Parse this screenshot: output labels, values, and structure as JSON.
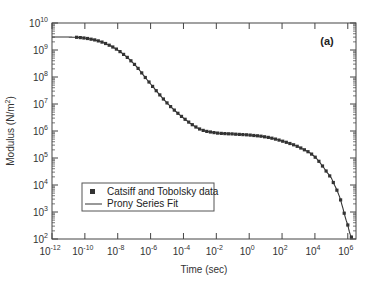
{
  "chart_data": {
    "type": "line",
    "title": "",
    "panel_label": "(a)",
    "xlabel": "Time (sec)",
    "ylabel": "Modulus (N/m",
    "ylabel_sup": "2",
    "ylabel_close": ")",
    "xscale": "log",
    "yscale": "log",
    "xlim_log10": [
      -12,
      6.5
    ],
    "ylim_log10": [
      2,
      10
    ],
    "x_ticks": [
      {
        "base": "10",
        "exp": "-12"
      },
      {
        "base": "10",
        "exp": "-10"
      },
      {
        "base": "10",
        "exp": "-8"
      },
      {
        "base": "10",
        "exp": "-6"
      },
      {
        "base": "10",
        "exp": "-4"
      },
      {
        "base": "10",
        "exp": "-2"
      },
      {
        "base": "10",
        "exp": "0"
      },
      {
        "base": "10",
        "exp": "2"
      },
      {
        "base": "10",
        "exp": "4"
      },
      {
        "base": "10",
        "exp": "6"
      }
    ],
    "y_ticks": [
      {
        "base": "10",
        "exp": "2"
      },
      {
        "base": "10",
        "exp": "3"
      },
      {
        "base": "10",
        "exp": "4"
      },
      {
        "base": "10",
        "exp": "5"
      },
      {
        "base": "10",
        "exp": "6"
      },
      {
        "base": "10",
        "exp": "7"
      },
      {
        "base": "10",
        "exp": "8"
      },
      {
        "base": "10",
        "exp": "9"
      },
      {
        "base": "10",
        "exp": "10"
      }
    ],
    "grid": false,
    "legend_position": "lower-left",
    "legend": [
      {
        "label": "Catsiff and Tobolsky data",
        "marker": "square"
      },
      {
        "label": "Prony Series Fit",
        "marker": "line"
      }
    ],
    "series": [
      {
        "name": "Prony Series Fit",
        "style": "line",
        "log10_time": [
          -12,
          -11,
          -10,
          -9,
          -8,
          -7,
          -6,
          -5,
          -4,
          -3,
          -2,
          -1,
          0,
          1,
          2,
          3,
          4,
          5,
          5.5,
          6,
          6.25
        ],
        "log10_modulus": [
          9.48,
          9.48,
          9.44,
          9.3,
          9.0,
          8.48,
          7.74,
          7.04,
          6.48,
          6.07,
          5.93,
          5.89,
          5.85,
          5.78,
          5.63,
          5.41,
          5.04,
          4.26,
          3.56,
          2.52,
          2.04
        ]
      },
      {
        "name": "Catsiff and Tobolsky data",
        "style": "markers",
        "log10_time_range": [
          -10.5,
          6.25
        ],
        "note": "dense square markers along the fit curve"
      }
    ],
    "colors": {
      "line": "#333333",
      "marker": "#333333",
      "axis": "#444444"
    }
  }
}
